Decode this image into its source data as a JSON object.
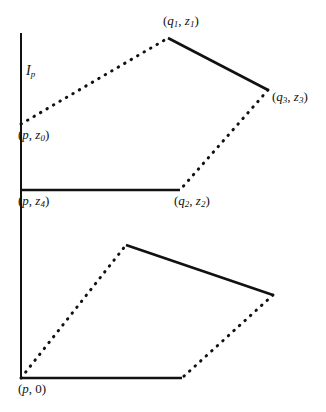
{
  "figure": {
    "type": "geometric-diagram",
    "background_color": "#ffffff",
    "stroke_color": "#111111",
    "axis": {
      "name": "vertical-axis",
      "x": 21,
      "y_top": 33,
      "y_bottom": 378,
      "style": "solid",
      "width": 2
    },
    "labels": {
      "interval": {
        "base": "I",
        "sub": "p",
        "text": "Iₚ"
      },
      "p_z0": {
        "open": "(",
        "base1": "p",
        "sep": ", ",
        "base2": "z",
        "sub2": "0",
        "close": ")"
      },
      "q1_z1": {
        "open": "(",
        "base1": "q",
        "sub1": "1",
        "sep": ", ",
        "base2": "z",
        "sub2": "1",
        "close": ")"
      },
      "q3_z3": {
        "open": "(",
        "base1": "q",
        "sub1": "3",
        "sep": ", ",
        "base2": "z",
        "sub2": "3",
        "close": ")"
      },
      "p_z4": {
        "open": "(",
        "base1": "p",
        "sep": ", ",
        "base2": "z",
        "sub2": "4",
        "close": ")"
      },
      "q2_z2": {
        "open": "(",
        "base1": "q",
        "sub1": "2",
        "sep": ", ",
        "base2": "z",
        "sub2": "2",
        "close": ")"
      },
      "p_0": {
        "open": "(",
        "base1": "p",
        "sep": ", ",
        "base2": "0",
        "close": ")"
      }
    },
    "points": {
      "p_z0": {
        "x": 21,
        "y": 124
      },
      "q1_z1": {
        "x": 168,
        "y": 38
      },
      "q3_z3": {
        "x": 268,
        "y": 90
      },
      "q2_z2": {
        "x": 180,
        "y": 190
      },
      "p_z4": {
        "x": 21,
        "y": 190
      },
      "p_0": {
        "x": 21,
        "y": 378
      },
      "lower_top": {
        "x": 126,
        "y": 245
      },
      "lower_right": {
        "x": 273,
        "y": 295
      },
      "lower_bottom": {
        "x": 182,
        "y": 378
      }
    },
    "edges": [
      {
        "name": "edge-pz0-q1z1",
        "from": "p_z0",
        "to": "q1_z1",
        "style": "dotted"
      },
      {
        "name": "edge-q1z1-q3z3",
        "from": "q1_z1",
        "to": "q3_z3",
        "style": "solid"
      },
      {
        "name": "edge-q3z3-q2z2",
        "from": "q3_z3",
        "to": "q2_z2",
        "style": "dotted"
      },
      {
        "name": "edge-pz4-q2z2",
        "from": "p_z4",
        "to": "q2_z2",
        "style": "solid"
      },
      {
        "name": "edge-p0-lower-top",
        "from": "p_0",
        "to": "lower_top",
        "style": "dotted"
      },
      {
        "name": "edge-lower-top-right",
        "from": "lower_top",
        "to": "lower_right",
        "style": "solid"
      },
      {
        "name": "edge-lower-right-bottom",
        "from": "lower_right",
        "to": "lower_bottom",
        "style": "dotted"
      },
      {
        "name": "edge-p0-lower-bottom",
        "from": "p_0",
        "to": "lower_bottom",
        "style": "solid"
      }
    ]
  }
}
